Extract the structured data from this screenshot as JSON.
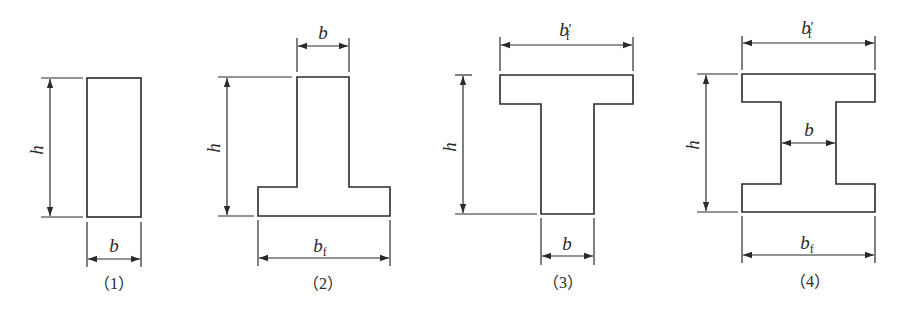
{
  "figures": [
    {
      "id": "1",
      "shape": "rectangular section",
      "caption": "（1）",
      "labels": {
        "h": "h",
        "b": "b"
      }
    },
    {
      "id": "2",
      "shape": "inverted T section (bottom flange)",
      "caption": "（2）",
      "labels": {
        "h": "h",
        "b": "b",
        "bf_base": "b",
        "bf_sub": "f"
      }
    },
    {
      "id": "3",
      "shape": "T section (top flange)",
      "caption": "（3）",
      "labels": {
        "h": "h",
        "b": "b",
        "bfp_base": "b",
        "bfp_prime": "′",
        "bfp_sub": "f"
      }
    },
    {
      "id": "4",
      "shape": "I section",
      "caption": "（4）",
      "labels": {
        "h": "h",
        "b": "b",
        "bfp_base": "b",
        "bfp_prime": "′",
        "bfp_sub": "f",
        "bf_base": "b",
        "bf_sub": "f"
      }
    }
  ]
}
